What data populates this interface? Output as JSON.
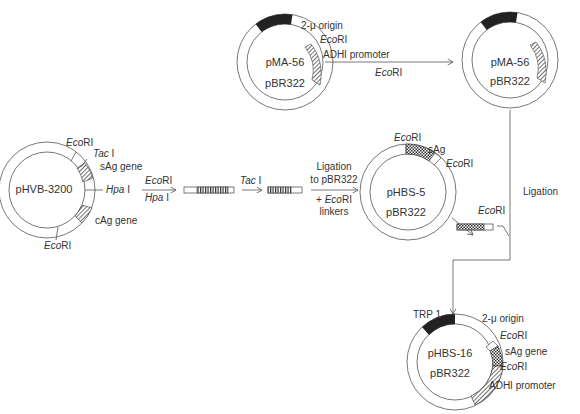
{
  "diagram": {
    "plasmids": {
      "pma56_left": {
        "name": "pMA-56",
        "backbone": "pBR322",
        "labels": {
          "origin": "2-μ origin",
          "site": "EcoRI",
          "promoter": "ADHI promoter"
        }
      },
      "pma56_right": {
        "name": "pMA-56",
        "backbone": "pBR322"
      },
      "phvb3200": {
        "name": "pHVB-3200",
        "labels": {
          "ecori_top": "EcoRI",
          "taci": "Tac I",
          "sag": "sAg gene",
          "hpai": "Hpa I",
          "cag": "cAg gene",
          "ecori_bottom": "EcoRI"
        }
      },
      "phbs5": {
        "name": "pHBS-5",
        "backbone": "pBR322",
        "labels": {
          "ecori_left": "EcoRI",
          "sag": "sAg",
          "ecori_right": "EcoRI"
        }
      },
      "phbs16": {
        "name": "pHBS-16",
        "backbone": "pBR322",
        "labels": {
          "trp1": "TRP 1",
          "origin": "2-μ origin",
          "ecori_1": "EcoRI",
          "sag": "sAg gene",
          "ecori_2": "EcoRI",
          "promoter": "ADHI promoter"
        }
      }
    },
    "steps": {
      "step1": {
        "enzyme1": "EcoRI",
        "enzyme2": "Hpa I"
      },
      "step2": {
        "enzyme": "Tac I"
      },
      "step3": {
        "line1": "Ligation",
        "line2": "to pBR322",
        "line3": "+ EcoRI",
        "line4": "linkers"
      },
      "top_arrow": {
        "enzyme": "EcoRI"
      },
      "excise": {
        "enzyme": "EcoRI"
      },
      "final": {
        "label": "Ligation"
      }
    }
  }
}
